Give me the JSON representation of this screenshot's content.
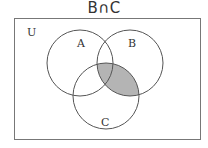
{
  "title": "B∩C",
  "diagram": {
    "type": "venn",
    "universe_label": "U",
    "sets": [
      {
        "name": "A",
        "label": "A",
        "cx": 80,
        "cy": 63,
        "r": 33
      },
      {
        "name": "B",
        "label": "B",
        "cx": 130,
        "cy": 63,
        "r": 33
      },
      {
        "name": "C",
        "label": "C",
        "cx": 106,
        "cy": 96,
        "r": 33
      }
    ],
    "shaded_region": "B∩C",
    "colors": {
      "stroke": "#555555",
      "shade": "#b4b4b4",
      "background": "#ffffff",
      "universe_border": "#777777"
    }
  }
}
